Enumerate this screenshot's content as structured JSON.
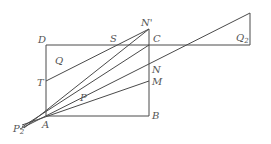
{
  "diagram": {
    "type": "geometry",
    "points": {
      "A": {
        "label": "A",
        "x": 46,
        "y": 116
      },
      "B": {
        "label": "B",
        "x": 149,
        "y": 116
      },
      "C": {
        "label": "C",
        "x": 149,
        "y": 45
      },
      "D": {
        "label": "D",
        "x": 46,
        "y": 45
      },
      "N_prime": {
        "label": "N'",
        "x": 149,
        "y": 29
      },
      "N": {
        "label": "N",
        "x": 149,
        "y": 64
      },
      "M": {
        "label": "M",
        "x": 149,
        "y": 81
      },
      "S": {
        "label": "S",
        "x": 117,
        "y": 45
      },
      "T": {
        "label": "T",
        "x": 46,
        "y": 81
      },
      "P": {
        "label": "P",
        "x": 82,
        "y": 99
      },
      "P2": {
        "label": "P",
        "sub": "2",
        "x": 20,
        "y": 128
      },
      "Q": {
        "label": "Q"
      },
      "Q2": {
        "label": "Q",
        "sub": "2"
      }
    },
    "labels": {
      "D": "D",
      "S": "S",
      "N_prime": "N'",
      "C": "C",
      "Q": "Q",
      "Q2_main": "Q",
      "Q2_sub": "2",
      "T": "T",
      "N": "N",
      "M": "M",
      "P": "P",
      "A": "A",
      "B": "B",
      "P2_main": "P",
      "P2_sub": "2"
    },
    "line_color": "#4a4a4a",
    "label_color": "#555555"
  }
}
